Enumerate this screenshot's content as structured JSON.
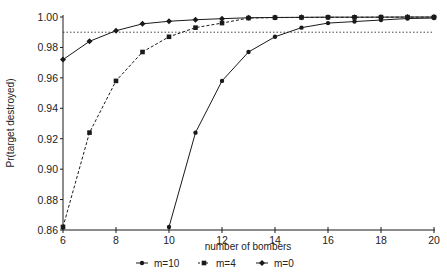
{
  "chart_data": {
    "type": "line",
    "title": "",
    "xlabel": "number of bombers",
    "ylabel": "Pr(target destroyed)",
    "xlim": [
      6,
      20
    ],
    "ylim": [
      0.86,
      1.0
    ],
    "xticks": [
      6,
      8,
      10,
      12,
      14,
      16,
      18,
      20
    ],
    "xtick_labels": [
      "6",
      "8",
      "10",
      "12",
      "14",
      "16",
      "18",
      "20"
    ],
    "yticks": [
      0.86,
      0.88,
      0.9,
      0.92,
      0.94,
      0.96,
      0.98,
      1.0
    ],
    "ytick_labels": [
      "0.86",
      "0.88",
      "0.90",
      "0.92",
      "0.94",
      "0.96",
      "0.98",
      "1.00"
    ],
    "grid": false,
    "legend_position": "bottom",
    "reference_line": {
      "y": 0.99,
      "style": "dotted"
    },
    "series": [
      {
        "name": "m=10",
        "line_style": "solid",
        "marker": "dot",
        "x": [
          10,
          11,
          12,
          13,
          14,
          15,
          16,
          17,
          18,
          19,
          20
        ],
        "values": [
          0.862,
          0.924,
          0.958,
          0.977,
          0.987,
          0.993,
          0.996,
          0.997,
          0.998,
          0.999,
          0.9993
        ]
      },
      {
        "name": "m=4",
        "line_style": "dashed",
        "marker": "square",
        "x": [
          6,
          7,
          8,
          9,
          10,
          11,
          12,
          13,
          14,
          15,
          16,
          17,
          18,
          19,
          20
        ],
        "values": [
          0.862,
          0.924,
          0.958,
          0.977,
          0.987,
          0.993,
          0.996,
          0.9993,
          0.9996,
          0.9997,
          0.9998,
          0.9998,
          0.9999,
          0.9999,
          0.9999
        ]
      },
      {
        "name": "m=0",
        "line_style": "solid",
        "marker": "diamond",
        "x": [
          6,
          7,
          8,
          9,
          10,
          11,
          12,
          13,
          14,
          15,
          16,
          17,
          18,
          19,
          20
        ],
        "values": [
          0.972,
          0.984,
          0.991,
          0.9955,
          0.9972,
          0.9982,
          0.9989,
          0.9995,
          0.9997,
          0.9998,
          0.9999,
          0.9999,
          0.9999,
          1.0,
          1.0
        ]
      }
    ]
  },
  "legend": {
    "items": [
      {
        "label": "m=10"
      },
      {
        "label": "m=4"
      },
      {
        "label": "m=0"
      }
    ]
  },
  "axes": {
    "xlabel": "number of bombers",
    "ylabel": "Pr(target destroyed)"
  },
  "colors": {
    "ink": "#1a1a1a",
    "background": "#ffffff"
  }
}
